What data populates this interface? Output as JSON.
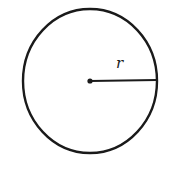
{
  "diagram": {
    "type": "circle-with-radius",
    "radius_label": "r",
    "stroke_color": "#1a1a1a",
    "background": "#ffffff",
    "circle": {
      "cx": 90,
      "cy": 81,
      "r": 67
    },
    "radius_line": {
      "x1": 90,
      "y1": 81,
      "x2": 157,
      "y2": 81
    },
    "center_dot": {
      "cx": 90,
      "cy": 81,
      "r": 2.5
    },
    "label_position": {
      "x": 118,
      "y": 67
    }
  }
}
